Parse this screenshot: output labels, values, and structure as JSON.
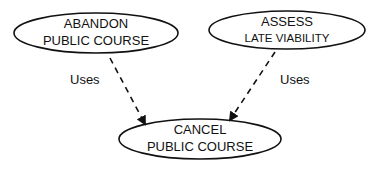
{
  "diagram": {
    "type": "use-case",
    "nodes": [
      {
        "id": "abandon",
        "line1": "ABANDON",
        "line2": "PUBLIC COURSE"
      },
      {
        "id": "assess",
        "line1": "ASSESS",
        "line2": "LATE VIABILITY"
      },
      {
        "id": "cancel",
        "line1": "CANCEL",
        "line2": "PUBLIC COURSE"
      }
    ],
    "edges": [
      {
        "from": "abandon",
        "to": "cancel",
        "label": "Uses",
        "style": "dashed"
      },
      {
        "from": "assess",
        "to": "cancel",
        "label": "Uses",
        "style": "dashed"
      }
    ],
    "colors": {
      "stroke": "#111111",
      "background": "#ffffff"
    }
  }
}
